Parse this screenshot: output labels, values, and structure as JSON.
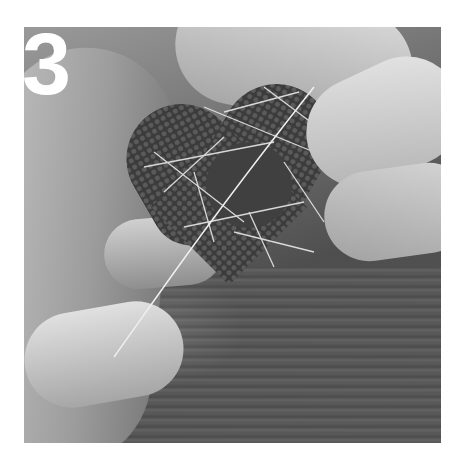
{
  "image": {
    "description": "Black and white photo of two hands wrapping thin white thread around a moss-covered heart with a dark felt circle in the center, over a wooden table",
    "step_number": "3",
    "colors": {
      "background": "#ffffff",
      "numeral": "#ffffff",
      "felt": "#404040"
    }
  }
}
